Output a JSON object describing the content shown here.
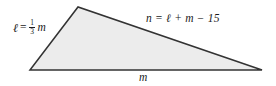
{
  "figure": {
    "type": "triangle-diagram",
    "background_color": "#ffffff",
    "shape": {
      "name": "triangle",
      "fill_color": "#ececec",
      "stroke_color": "#333333",
      "stroke_width": 1.5,
      "vertices": [
        {
          "name": "bottom-left",
          "x": 30,
          "y": 70
        },
        {
          "name": "apex",
          "x": 78,
          "y": 7
        },
        {
          "name": "bottom-right",
          "x": 262,
          "y": 70
        }
      ],
      "points_path": "30,70 78,7 262,70"
    },
    "labels": {
      "left_side": {
        "variable": "ℓ",
        "equals": "=",
        "fraction_numerator": "1",
        "fraction_denominator": "3",
        "trailing_variable": "m",
        "full_text": "ℓ = 1/3 m"
      },
      "hypotenuse": {
        "full_text": "n = ℓ + m − 15"
      },
      "base": {
        "full_text": "m"
      }
    }
  }
}
